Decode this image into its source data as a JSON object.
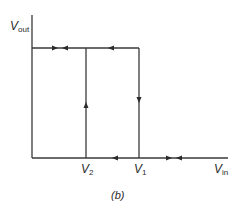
{
  "figure": {
    "caption": "(b)",
    "y_axis": {
      "label_main": "V",
      "label_sub": "out"
    },
    "x_axis": {
      "label_main": "V",
      "label_sub": "in"
    },
    "markers": [
      {
        "id": "v2",
        "label_main": "V",
        "label_sub": "2"
      },
      {
        "id": "v1",
        "label_main": "V",
        "label_sub": "1"
      }
    ],
    "line_color": "#3a3a3a"
  }
}
